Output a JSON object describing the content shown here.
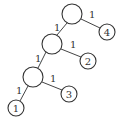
{
  "diagram": {
    "type": "binary-tree",
    "nodes": [
      {
        "id": "root",
        "label": "",
        "cx": 72,
        "cy": 14,
        "r": 10
      },
      {
        "id": "n4",
        "label": "4",
        "cx": 107,
        "cy": 32,
        "r": 8
      },
      {
        "id": "mid",
        "label": "",
        "cx": 52,
        "cy": 44,
        "r": 10
      },
      {
        "id": "n2",
        "label": "2",
        "cx": 88,
        "cy": 61,
        "r": 8
      },
      {
        "id": "low",
        "label": "",
        "cx": 33,
        "cy": 77,
        "r": 10
      },
      {
        "id": "n3",
        "label": "3",
        "cx": 69,
        "cy": 94,
        "r": 8
      },
      {
        "id": "n1",
        "label": "1",
        "cx": 16,
        "cy": 108,
        "r": 8
      }
    ],
    "edges": [
      {
        "from": "root",
        "to": "n4",
        "weight": "1"
      },
      {
        "from": "root",
        "to": "mid",
        "weight": "1"
      },
      {
        "from": "mid",
        "to": "n2",
        "weight": "1"
      },
      {
        "from": "mid",
        "to": "low",
        "weight": "1"
      },
      {
        "from": "low",
        "to": "n3",
        "weight": "1"
      },
      {
        "from": "low",
        "to": "n1",
        "weight": "1"
      }
    ]
  }
}
